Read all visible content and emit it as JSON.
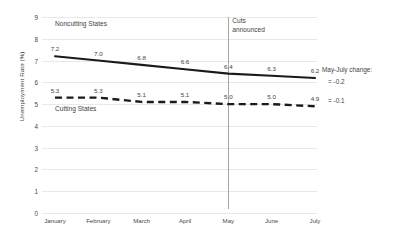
{
  "chart_data": {
    "type": "line",
    "title": "",
    "xlabel": "",
    "ylabel": "Unemployment Rate (%)",
    "ylim": [
      0,
      9
    ],
    "yticks": [
      "0",
      "1",
      "2",
      "3",
      "4",
      "5",
      "6",
      "7",
      "8",
      "9"
    ],
    "grid": true,
    "legend_position": "inline-labels",
    "categories": [
      "January",
      "February",
      "March",
      "April",
      "May",
      "June",
      "July"
    ],
    "series": [
      {
        "name": "Noncutting States",
        "style": "solid",
        "color": "#1a1a1a",
        "values": [
          7.2,
          7.0,
          6.8,
          6.6,
          6.4,
          6.3,
          6.2
        ],
        "labels": [
          "7.2",
          "7.0",
          "6.8",
          "6.6",
          "6.4",
          "6.3",
          "6.2"
        ]
      },
      {
        "name": "Cutting States",
        "style": "dashed",
        "color": "#1a1a1a",
        "values": [
          5.3,
          5.3,
          5.1,
          5.1,
          5.0,
          5.0,
          4.9
        ],
        "labels": [
          "5.3",
          "5.3",
          "5.1",
          "5.1",
          "5.0",
          "5.0",
          "4.9"
        ]
      }
    ],
    "annotations": {
      "event_marker": {
        "at_category": "May",
        "label_line1": "Cuts",
        "label_line2": "announced"
      },
      "side_note": {
        "title": "May-July change:",
        "noncutting": "= -0.2",
        "cutting": "= -0.1"
      }
    }
  }
}
